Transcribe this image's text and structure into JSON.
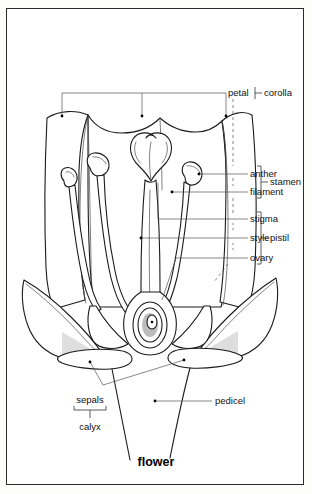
{
  "figure": {
    "title": "flower",
    "border_color": "#2b2b2b",
    "line_color": "#1a1a1a"
  },
  "labels": {
    "petal": "petal",
    "corolla": "corolla",
    "anther": "anther",
    "filament": "filament",
    "stamen": "stamen",
    "stigma": "stigma",
    "style": "style",
    "ovary": "ovary",
    "pistil": "pistil",
    "sepals": "sepals",
    "calyx": "calyx",
    "pedicel": "pedicel"
  },
  "groups": [
    {
      "name": "corolla",
      "members": [
        "petal"
      ]
    },
    {
      "name": "stamen",
      "members": [
        "anther",
        "filament"
      ]
    },
    {
      "name": "pistil",
      "members": [
        "stigma",
        "style",
        "ovary"
      ]
    },
    {
      "name": "calyx",
      "members": [
        "sepals"
      ]
    }
  ],
  "parts": [
    {
      "id": "petal",
      "label": "petal",
      "count": 3
    },
    {
      "id": "anther",
      "label": "anther",
      "count": 3
    },
    {
      "id": "filament",
      "label": "filament",
      "count": 3
    },
    {
      "id": "stigma",
      "label": "stigma",
      "count": 1
    },
    {
      "id": "style",
      "label": "style",
      "count": 1
    },
    {
      "id": "ovary",
      "label": "ovary",
      "count": 1
    },
    {
      "id": "sepals",
      "label": "sepals",
      "count": 2
    },
    {
      "id": "pedicel",
      "label": "pedicel",
      "count": 1
    }
  ]
}
